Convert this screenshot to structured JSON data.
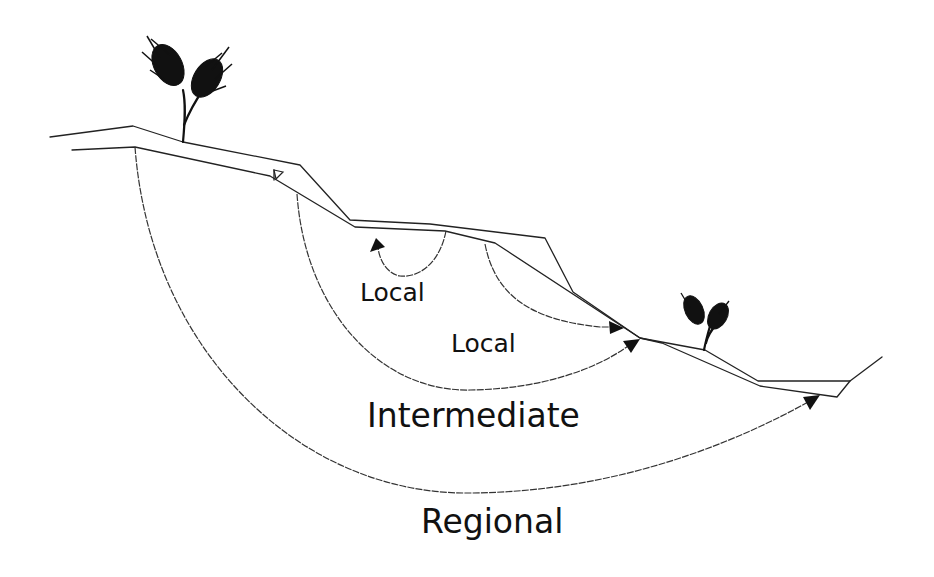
{
  "diagram": {
    "type": "hydrogeologic cross-section",
    "elements": {
      "ground_surface": "land surface profile",
      "water_table": "water table line with triangle marker",
      "plants": [
        "hilltop plant",
        "lowland plant"
      ]
    },
    "labels": {
      "local_1": "Local",
      "local_2": "Local",
      "intermediate": "Intermediate",
      "regional": "Regional"
    },
    "flow_systems": [
      {
        "name": "Local",
        "description": "short loop discharging at small depression"
      },
      {
        "name": "Local",
        "description": "discharges at mid-slope break"
      },
      {
        "name": "Intermediate",
        "description": "discharges at lower slope"
      },
      {
        "name": "Regional",
        "description": "deep flow discharging at valley bottom"
      }
    ],
    "colors": {
      "line": "#222222",
      "background": "#ffffff"
    }
  }
}
